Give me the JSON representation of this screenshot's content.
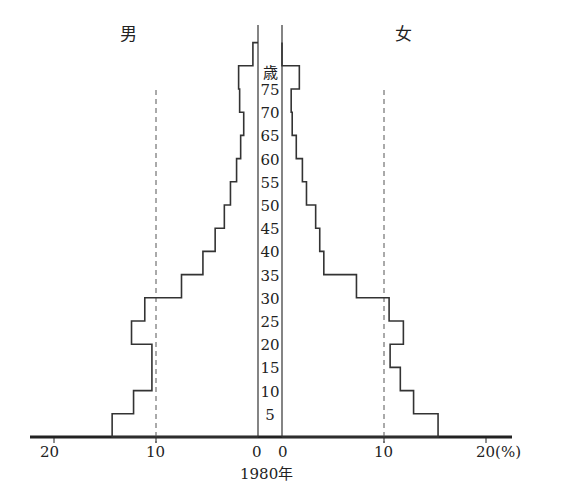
{
  "chart_data": {
    "type": "bar",
    "subtype": "population-pyramid-step",
    "title": "",
    "year_label": "1980年",
    "left_label": "男",
    "right_label": "女",
    "age_unit": "歳",
    "xlabel": "(%)",
    "xticks_left": [
      "20",
      "10",
      "0"
    ],
    "xticks_right": [
      "0",
      "10",
      "20(%)"
    ],
    "age_ticks": [
      "5",
      "10",
      "15",
      "20",
      "25",
      "30",
      "35",
      "40",
      "45",
      "50",
      "55",
      "60",
      "65",
      "70",
      "75"
    ],
    "categories": [
      "0-4",
      "5-9",
      "10-14",
      "15-19",
      "20-24",
      "25-29",
      "30-34",
      "35-39",
      "40-44",
      "45-49",
      "50-54",
      "55-59",
      "60-64",
      "65-69",
      "70-74",
      "75-79",
      "80+"
    ],
    "series": [
      {
        "name": "男",
        "values": [
          14.3,
          12.2,
          10.4,
          10.4,
          12.4,
          11.1,
          7.5,
          5.4,
          4.2,
          3.3,
          2.7,
          2.1,
          1.7,
          1.4,
          1.8,
          1.9,
          0.5
        ]
      },
      {
        "name": "女",
        "values": [
          15.3,
          12.9,
          11.6,
          10.6,
          11.9,
          10.5,
          7.3,
          4.1,
          3.7,
          3.3,
          2.4,
          2.0,
          1.4,
          1.0,
          0.9,
          1.7,
          0.0
        ]
      }
    ],
    "xlim": [
      0,
      20
    ],
    "reference_lines": [
      10
    ],
    "grid": false
  },
  "labels": {
    "male": "男",
    "female": "女",
    "age_unit": "歳",
    "year": "1980年",
    "tick_left_20": "20",
    "tick_left_10": "10",
    "tick_left_0": "0",
    "tick_right_0": "0",
    "tick_right_10": "10",
    "tick_right_20": "20(%)"
  }
}
